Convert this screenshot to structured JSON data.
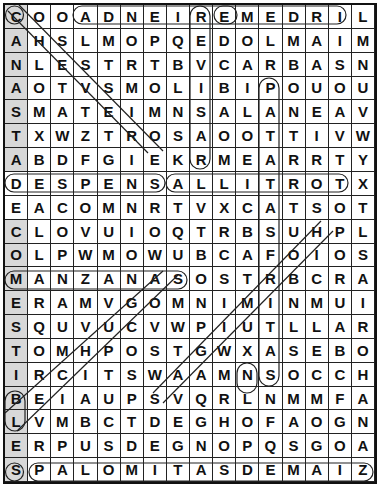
{
  "puzzle": {
    "type": "word-search",
    "rows": 20,
    "cols": 16,
    "grid": [
      "COOADNEIREMEDRIL",
      "AHSLMOPQEDOLMAIM",
      "NLESTRTBVCARBASN",
      "AOTVSMOLIBIPOUOU",
      "SMATEIMNSALANEAV",
      "TXWZTROSAOOTTIVW",
      "ABDFGIEKRMEARRTY",
      "DESPENSALLITROTX",
      "EACOMNRTVXCATSOT",
      "CLOVUIOQTRBSUHPL",
      "OLPWMOWUBCAFOIOS",
      "MANZANASOSTRBCRA",
      "ERAMVGOMNIMINMUI",
      "SQUVUCVWPIUTLLAR",
      "TOMHPOSTGWXASEBO",
      "IRCITSWAAMNSOCCH",
      "BEIAUPSVQRLNMMFA",
      "LVMBCTDEGHOFAOGN",
      "ERPUSDEGNOPQSGOA",
      "SPALOMITASDEMAIZ"
    ],
    "found_words": [
      {
        "word": "ADNEIREM",
        "note": "row 0 horizontal loop",
        "start": [
          0,
          3
        ],
        "end": [
          0,
          10
        ]
      },
      {
        "word": "REMEDRI",
        "note": "row 0 loop",
        "start": [
          0,
          8
        ],
        "end": [
          0,
          14
        ]
      },
      {
        "word": "DESPENSA",
        "start": [
          7,
          0
        ],
        "end": [
          7,
          7
        ]
      },
      {
        "word": "ALLITROT",
        "start": [
          7,
          7
        ],
        "end": [
          7,
          14
        ]
      },
      {
        "word": "MANZANAS",
        "start": [
          11,
          0
        ],
        "end": [
          11,
          7
        ]
      },
      {
        "word": "PALOMITAS",
        "start": [
          19,
          1
        ],
        "end": [
          19,
          9
        ]
      },
      {
        "word": "PALOMITASDEMAIZ",
        "start": [
          19,
          1
        ],
        "end": [
          19,
          15
        ]
      },
      {
        "word": "REBISAR",
        "start": [
          0,
          8
        ],
        "end": [
          6,
          8
        ]
      },
      {
        "word": "PATATASFRITAS",
        "start": [
          3,
          11
        ],
        "end": [
          15,
          11
        ]
      },
      {
        "word": "CANASTA",
        "start": [
          0,
          0
        ],
        "end": [
          6,
          0
        ]
      },
      {
        "word": "COMESTIBLES",
        "start": [
          9,
          0
        ],
        "end": [
          19,
          0
        ]
      },
      {
        "word": "CHEESE-diag",
        "start": [
          0,
          0
        ],
        "end": [
          6,
          6
        ]
      },
      {
        "word": "diag-H",
        "start": [
          9,
          13
        ],
        "end": [
          16,
          6
        ]
      },
      {
        "word": "diag-A",
        "start": [
          11,
          6
        ],
        "end": [
          17,
          0
        ]
      }
    ]
  }
}
